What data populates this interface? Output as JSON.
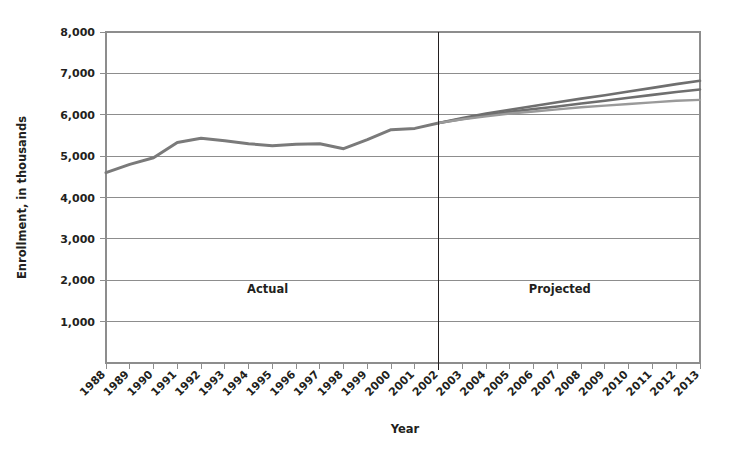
{
  "chart_data": {
    "type": "line",
    "title": "",
    "xlabel": "Year",
    "ylabel": "Enrollment, in thousands",
    "xlim": [
      1988,
      2013
    ],
    "ylim": [
      0,
      8000
    ],
    "grid": true,
    "legend_position": "none",
    "x": [
      1988,
      1989,
      1990,
      1991,
      1992,
      1993,
      1994,
      1995,
      1996,
      1997,
      1998,
      1999,
      2000,
      2001,
      2002,
      2003,
      2004,
      2005,
      2006,
      2007,
      2008,
      2009,
      2010,
      2011,
      2012,
      2013
    ],
    "xtick_labels": [
      "1988",
      "1989",
      "1990",
      "1991",
      "1992",
      "1993",
      "1994",
      "1995",
      "1996",
      "1997",
      "1998",
      "1999",
      "2000",
      "2001",
      "2002",
      "2003",
      "2004",
      "2005",
      "2006",
      "2007",
      "2008",
      "2009",
      "2010",
      "2011",
      "2012",
      "2013"
    ],
    "ytick_values": [
      1000,
      2000,
      3000,
      4000,
      5000,
      6000,
      7000,
      8000
    ],
    "ytick_labels": [
      "1,000",
      "2,000",
      "3,000",
      "4,000",
      "5,000",
      "6,000",
      "7,000",
      "8,000"
    ],
    "annotations": [
      {
        "text": "Actual",
        "x": 1994.8,
        "y": 1700
      },
      {
        "text": "Projected",
        "x": 2007.1,
        "y": 1700
      }
    ],
    "divider_x": 2002,
    "series": [
      {
        "name": "Actual enrollment",
        "color": "#7a7a7a",
        "width": 3.0,
        "x": [
          1988,
          1989,
          1990,
          1991,
          1992,
          1993,
          1994,
          1995,
          1996,
          1997,
          1998,
          1999,
          2000,
          2001,
          2002
        ],
        "values": [
          4600,
          4800,
          4960,
          5330,
          5430,
          5370,
          5300,
          5250,
          5290,
          5300,
          5180,
          5400,
          5640,
          5670,
          5800
        ]
      },
      {
        "name": "Projected high",
        "color": "#6f6f6f",
        "width": 2.6,
        "x": [
          2002,
          2003,
          2004,
          2005,
          2006,
          2007,
          2008,
          2009,
          2010,
          2011,
          2012,
          2013
        ],
        "values": [
          5800,
          5920,
          6030,
          6120,
          6210,
          6300,
          6390,
          6470,
          6560,
          6650,
          6740,
          6820
        ]
      },
      {
        "name": "Projected middle",
        "color": "#6f6f6f",
        "width": 2.6,
        "x": [
          2002,
          2003,
          2004,
          2005,
          2006,
          2007,
          2008,
          2009,
          2010,
          2011,
          2012,
          2013
        ],
        "values": [
          5800,
          5900,
          5990,
          6070,
          6140,
          6200,
          6270,
          6340,
          6410,
          6480,
          6550,
          6610
        ]
      },
      {
        "name": "Projected low",
        "color": "#9a9a9a",
        "width": 2.4,
        "x": [
          2002,
          2003,
          2004,
          2005,
          2006,
          2007,
          2008,
          2009,
          2010,
          2011,
          2012,
          2013
        ],
        "values": [
          5800,
          5890,
          5960,
          6030,
          6080,
          6130,
          6180,
          6220,
          6260,
          6300,
          6340,
          6360
        ]
      }
    ]
  }
}
